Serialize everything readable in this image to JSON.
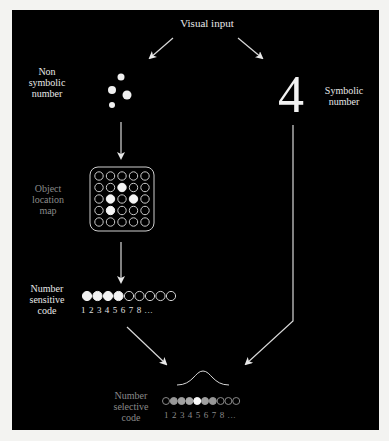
{
  "diagram": {
    "title": "Visual input",
    "left_branch": {
      "label": "Non\nsymbolic\nnumber",
      "dots": [
        {
          "cx": 121,
          "cy": 77,
          "r": 3.5
        },
        {
          "cx": 112,
          "cy": 90,
          "r": 4
        },
        {
          "cx": 127,
          "cy": 95,
          "r": 4.5
        },
        {
          "cx": 112,
          "cy": 105,
          "r": 3
        }
      ]
    },
    "right_branch": {
      "symbol": "4",
      "label": "Symbolic\nnumber"
    },
    "object_location_map": {
      "label": "Object\nlocation\nmap",
      "rows": 5,
      "cols": 5,
      "filled": [
        [
          1,
          2
        ],
        [
          2,
          1
        ],
        [
          2,
          3
        ],
        [
          3,
          1
        ]
      ]
    },
    "number_sensitive_code": {
      "label": "Number\nsensitive\ncode",
      "units": 9,
      "filled_count": 4,
      "digits": "1 2 3 4 5 6 7 8 ..."
    },
    "number_selective_code": {
      "label": "Number\nselective\ncode",
      "units": 10,
      "activations": [
        0,
        0.45,
        0.5,
        0.55,
        1.0,
        0.5,
        0.45,
        0,
        0,
        0
      ],
      "digits": "1 2 3 4 5 6 7 8 ..."
    },
    "colors": {
      "background": "#000000",
      "foreground": "#e8e8e8",
      "dim_text": "#8a8a8a",
      "page": "#f3f3f1"
    }
  }
}
